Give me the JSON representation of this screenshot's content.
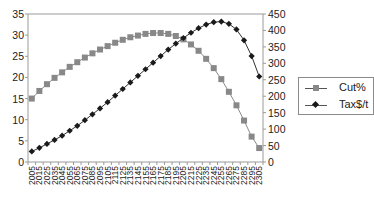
{
  "chart_data": {
    "type": "line",
    "title": "",
    "xlabel": "",
    "ylabel": "",
    "y2label": "",
    "categories": [
      "2005",
      "2015",
      "2025",
      "2035",
      "2045",
      "2055",
      "2065",
      "2075",
      "2085",
      "2095",
      "2105",
      "2115",
      "2125",
      "2135",
      "2145",
      "2155",
      "2165",
      "2175",
      "2185",
      "2195",
      "2205",
      "2215",
      "2225",
      "2235",
      "2245",
      "2255",
      "2265",
      "2275",
      "2285",
      "2295",
      "2305"
    ],
    "ylim": [
      0,
      35
    ],
    "yticks": [
      "0",
      "5",
      "10",
      "15",
      "20",
      "25",
      "30",
      "35"
    ],
    "y2lim": [
      0,
      450
    ],
    "y2ticks": [
      "0",
      "50",
      "100",
      "150",
      "200",
      "250",
      "300",
      "350",
      "400",
      "450"
    ],
    "grid": false,
    "legend_position": "right",
    "series": [
      {
        "name": "Cut%",
        "axis": "left",
        "color": "#888888",
        "marker": "square",
        "values": [
          15.0,
          16.8,
          18.4,
          19.9,
          21.2,
          22.5,
          23.6,
          24.7,
          25.7,
          26.6,
          27.4,
          28.2,
          28.9,
          29.5,
          29.9,
          30.3,
          30.5,
          30.5,
          30.3,
          29.8,
          29.0,
          27.8,
          26.3,
          24.4,
          22.2,
          19.6,
          16.6,
          13.4,
          9.8,
          6.0,
          3.3
        ]
      },
      {
        "name": "Tax$/t",
        "axis": "right",
        "color": "#1a1a1a",
        "marker": "diamond",
        "values": [
          32,
          43,
          55,
          67,
          80,
          95,
          110,
          127,
          145,
          163,
          182,
          202,
          222,
          242,
          262,
          282,
          302,
          322,
          342,
          360,
          377,
          393,
          407,
          418,
          425,
          427,
          420,
          403,
          370,
          322,
          260
        ]
      }
    ]
  }
}
